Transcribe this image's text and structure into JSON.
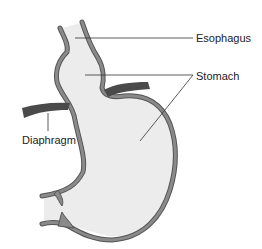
{
  "diagram": {
    "labels": [
      {
        "id": "esophagus",
        "text": "Esophagus"
      },
      {
        "id": "stomach",
        "text": "Stomach"
      },
      {
        "id": "diaphragm",
        "text": "Diaphragm"
      }
    ]
  },
  "colors": {
    "background": "#ffffff",
    "organ_fill": "#ececec",
    "wall": "#8a8a8a",
    "wall_outline": "#555555",
    "diaphragm": "#4a4a4a",
    "leader_line": "#333333",
    "text": "#222222"
  }
}
